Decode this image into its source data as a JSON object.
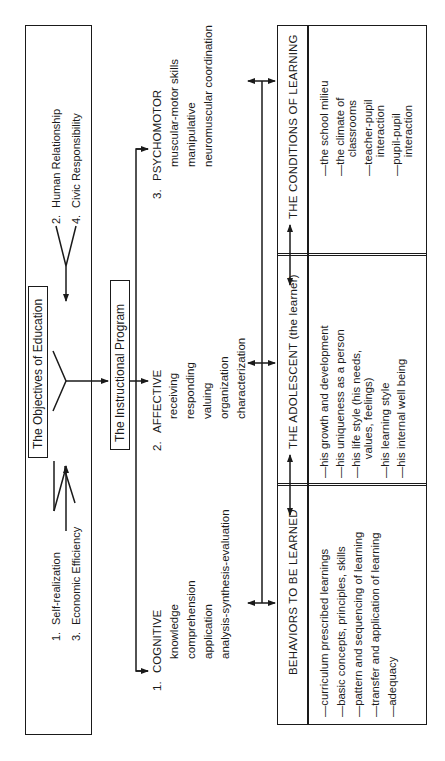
{
  "objectives": {
    "title": "The Objectives of Education",
    "items": [
      {
        "num": "1.",
        "label": "Self-realization"
      },
      {
        "num": "2.",
        "label": "Human Relationship"
      },
      {
        "num": "3.",
        "label": "Economic Efficiency"
      },
      {
        "num": "4.",
        "label": "Civic Responsibility"
      }
    ]
  },
  "program": {
    "title": "The Instructional Program"
  },
  "domains": [
    {
      "num": "1.",
      "title": "COGNITIVE",
      "items": [
        "knowledge",
        "comprehension",
        "application",
        "analysis-synthesis-evaluation"
      ]
    },
    {
      "num": "2.",
      "title": "AFFECTIVE",
      "items": [
        "receiving",
        "responding",
        "valuing",
        "organization",
        "characterization"
      ]
    },
    {
      "num": "3.",
      "title": "PSYCHOMOTOR",
      "items": [
        "muscular-motor skills",
        "manipulative",
        "neuromuscular coordination"
      ]
    }
  ],
  "table": {
    "columns": [
      {
        "header": "BEHAVIORS TO BE LEARNED",
        "items": [
          "—curriculum  prescribed learnings",
          "—basic concepts, principles, skills",
          "—pattern and sequencing of learning",
          "—transfer and application of learning",
          "—adequacy"
        ]
      },
      {
        "header": "THE ADOLESCENT  (the learner)",
        "items": [
          "—his growth and development",
          "—his uniqueness as a person",
          "—his life style (his needs,",
          "      values, feelings)",
          "—his learning style",
          "—his internal well being"
        ]
      },
      {
        "header": "THE CONDITIONS OF LEARNING",
        "items": [
          "—the school milieu",
          "—the climate of",
          "      classrooms",
          "—teacher-pupil",
          "      interaction",
          "—pupil-pupil",
          "      interaction"
        ]
      }
    ]
  }
}
